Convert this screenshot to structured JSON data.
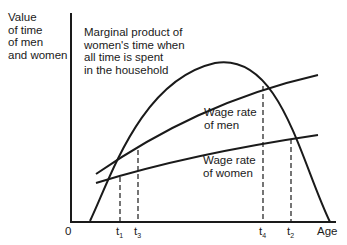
{
  "diagram": {
    "y_axis_label": [
      "Value",
      "of time",
      "of men",
      "and women"
    ],
    "x_axis_label": "Age",
    "origin_label": "0",
    "curves": [
      {
        "name": "Marginal product of women's time when all time is spent in the household",
        "label_lines": [
          "Marginal product of",
          "women's time when",
          "all time is spent",
          "in the household"
        ],
        "shape": "hump"
      },
      {
        "name": "Wage rate of men",
        "label_lines": [
          "Wage rate",
          "of men"
        ],
        "shape": "rising-concave"
      },
      {
        "name": "Wage rate of women",
        "label_lines": [
          "Wage rate",
          "of women"
        ],
        "shape": "rising-concave"
      }
    ],
    "x_ticks": [
      {
        "main": "t",
        "sub": "1"
      },
      {
        "main": "t",
        "sub": "3"
      },
      {
        "main": "t",
        "sub": "4"
      },
      {
        "main": "t",
        "sub": "2"
      }
    ],
    "line_color": "#1a1a1a"
  }
}
